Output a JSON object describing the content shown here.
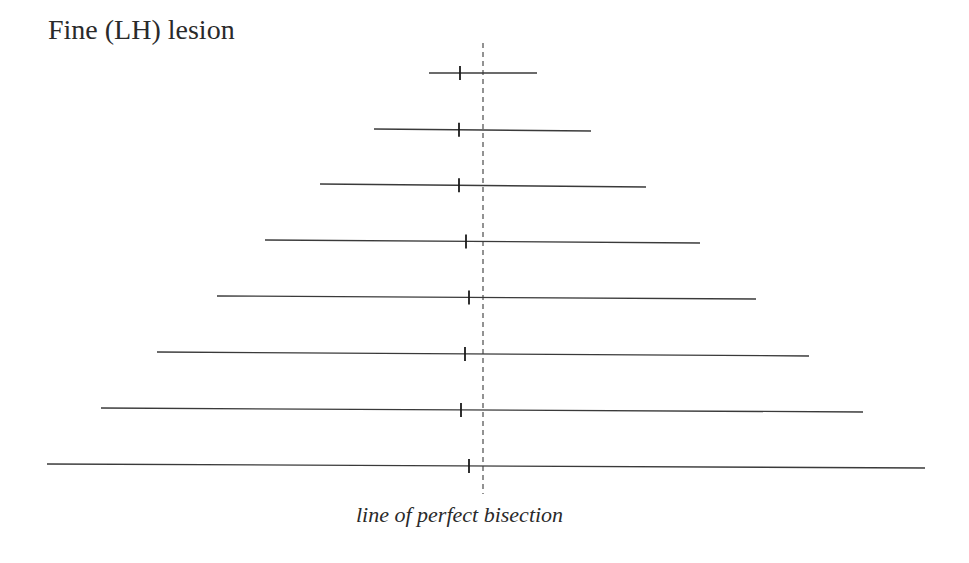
{
  "figure": {
    "title": "Fine (LH) lesion",
    "caption": "line of perfect bisection",
    "colors": {
      "line": "#3a3a3a",
      "tick": "#1a1a1a",
      "dashed": "#3a3a3a",
      "text": "#2a2a2a"
    }
  },
  "bisection_line": {
    "x": 483,
    "y_start": 43,
    "y_end": 494,
    "dash": "5,4"
  },
  "lines": [
    {
      "index": 1,
      "x_start": 429,
      "x_end": 537,
      "y1": 73,
      "y2": 73,
      "mark_x": 460
    },
    {
      "index": 2,
      "x_start": 374,
      "x_end": 591,
      "y1": 129,
      "y2": 131,
      "mark_x": 459
    },
    {
      "index": 3,
      "x_start": 320,
      "x_end": 646,
      "y1": 184,
      "y2": 187,
      "mark_x": 459
    },
    {
      "index": 4,
      "x_start": 265,
      "x_end": 700,
      "y1": 240,
      "y2": 243,
      "mark_x": 466
    },
    {
      "index": 5,
      "x_start": 217,
      "x_end": 756,
      "y1": 296,
      "y2": 299,
      "mark_x": 469
    },
    {
      "index": 6,
      "x_start": 157,
      "x_end": 809,
      "y1": 352,
      "y2": 356,
      "mark_x": 465
    },
    {
      "index": 7,
      "x_start": 101,
      "x_end": 863,
      "y1": 408,
      "y2": 412,
      "mark_x": 461
    },
    {
      "index": 8,
      "x_start": 47,
      "x_end": 925,
      "y1": 464,
      "y2": 468,
      "mark_x": 469
    }
  ]
}
